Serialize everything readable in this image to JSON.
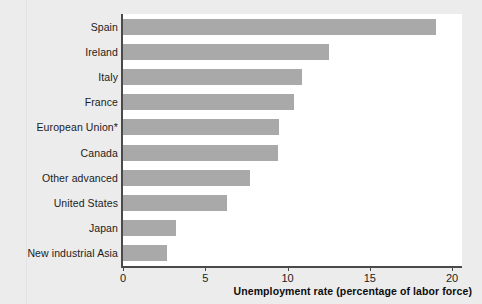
{
  "chart_data": {
    "type": "bar",
    "orientation": "horizontal",
    "title": "",
    "xlabel": "Unemployment rate (percentage of labor force)",
    "ylabel": "",
    "xlim": [
      0,
      20.8
    ],
    "xticks": [
      0,
      5,
      10,
      15,
      20
    ],
    "xtick_labels": [
      "0",
      "5",
      "10",
      "15",
      "20"
    ],
    "grid": false,
    "legend": false,
    "bar_color": "#a9a9a9",
    "categories": [
      "Spain",
      "Ireland",
      "Italy",
      "France",
      "European Union*",
      "Canada",
      "Other advanced",
      "United States",
      "Japan",
      "New industrial Asia"
    ],
    "values": [
      19.0,
      12.5,
      10.9,
      10.4,
      9.5,
      9.4,
      7.7,
      6.3,
      3.2,
      2.7
    ]
  },
  "axis": {
    "x_title": "Unemployment rate (percentage of labor force)"
  }
}
